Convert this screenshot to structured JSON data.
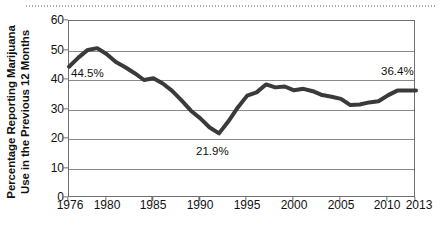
{
  "chart_data": {
    "type": "line",
    "title": "",
    "xlabel": "",
    "ylabel": "Percentage Reporting Marijuana Use in the Previous 12 Months",
    "ylabel_line1": "Percentage Reporting Marijuana",
    "ylabel_line2": "Use in the Previous 12 Months",
    "xlim": [
      1976,
      2013
    ],
    "ylim": [
      0,
      60
    ],
    "ytick_labels": [
      "0",
      "10",
      "20",
      "30",
      "40",
      "50",
      "60"
    ],
    "yticks": [
      0,
      10,
      20,
      30,
      40,
      50,
      60
    ],
    "xtick_labels": [
      "1976",
      "1980",
      "1985",
      "1990",
      "1995",
      "2000",
      "2005",
      "2010",
      "2013"
    ],
    "xticks": [
      1976,
      1980,
      1985,
      1990,
      1995,
      2000,
      2005,
      2010,
      2013
    ],
    "grid": "horizontal",
    "legend": "none",
    "line_color": "#3a3a3a",
    "line_width": 4,
    "x": [
      1976,
      1977,
      1978,
      1979,
      1980,
      1981,
      1982,
      1983,
      1984,
      1985,
      1986,
      1987,
      1988,
      1989,
      1990,
      1991,
      1992,
      1993,
      1994,
      1995,
      1996,
      1997,
      1998,
      1999,
      2000,
      2001,
      2002,
      2003,
      2004,
      2005,
      2006,
      2007,
      2008,
      2009,
      2010,
      2011,
      2012,
      2013
    ],
    "values": [
      44.5,
      47.6,
      50.2,
      50.8,
      48.8,
      46.1,
      44.3,
      42.3,
      40.0,
      40.6,
      38.8,
      36.3,
      33.1,
      29.6,
      27.0,
      23.9,
      21.9,
      26.0,
      30.7,
      34.7,
      35.8,
      38.5,
      37.5,
      37.8,
      36.5,
      37.0,
      36.2,
      34.9,
      34.3,
      33.6,
      31.5,
      31.7,
      32.4,
      32.8,
      34.8,
      36.4,
      36.4,
      36.4
    ],
    "annotations": [
      {
        "label": "44.5%",
        "year": 1976,
        "value": 44.5
      },
      {
        "label": "21.9%",
        "year": 1992,
        "value": 21.9
      },
      {
        "label": "36.4%",
        "year": 2013,
        "value": 36.4
      }
    ]
  }
}
